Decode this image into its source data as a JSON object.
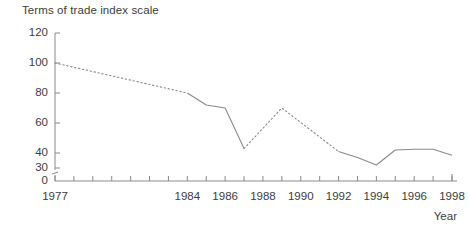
{
  "chart_data": {
    "type": "line",
    "title": "Terms of trade index scale",
    "xlabel": "Year",
    "ylabel": "",
    "xlim": [
      1977,
      1998
    ],
    "ylim": [
      30,
      120
    ],
    "y_axis_break": true,
    "y_axis_break_note": "axis broken between 0 and 30",
    "grid": false,
    "legend": false,
    "yticks": [
      0,
      30,
      40,
      60,
      80,
      100,
      120
    ],
    "ytick_labels": [
      "0",
      "30",
      "40",
      "60",
      "80",
      "100",
      "120"
    ],
    "xticks": [
      1977,
      1978,
      1979,
      1980,
      1981,
      1982,
      1983,
      1984,
      1985,
      1986,
      1987,
      1988,
      1989,
      1990,
      1991,
      1992,
      1993,
      1994,
      1995,
      1996,
      1997,
      1998
    ],
    "xtick_labels": [
      "1977",
      "1984",
      "1986",
      "1988",
      "1990",
      "1992",
      "1994",
      "1996",
      "1998"
    ],
    "xtick_label_years": [
      1977,
      1984,
      1986,
      1988,
      1990,
      1992,
      1994,
      1996,
      1998
    ],
    "line_color": "#8a8a8a",
    "series": [
      {
        "name": "Terms of trade index",
        "x": [
          1977,
          1984,
          1985,
          1986,
          1987,
          1989,
          1992,
          1993,
          1994,
          1995,
          1996,
          1997,
          1998
        ],
        "values": [
          100,
          80,
          72,
          70,
          43,
          70,
          41,
          37,
          32,
          42,
          42.5,
          42.5,
          38.5
        ],
        "segments": [
          {
            "style": "dotted",
            "x": [
              1977,
              1984
            ],
            "values": [
              100,
              80
            ]
          },
          {
            "style": "solid",
            "x": [
              1984,
              1985,
              1986,
              1987
            ],
            "values": [
              80,
              72,
              70,
              43
            ]
          },
          {
            "style": "dotted",
            "x": [
              1987,
              1989,
              1992
            ],
            "values": [
              43,
              70,
              41
            ]
          },
          {
            "style": "solid",
            "x": [
              1992,
              1993,
              1994,
              1995,
              1996,
              1997,
              1998
            ],
            "values": [
              41,
              37,
              32,
              42,
              42.5,
              42.5,
              38.5
            ]
          }
        ]
      }
    ]
  },
  "chart": {
    "title": "Terms of trade index scale",
    "year_axis_label": "Year"
  }
}
